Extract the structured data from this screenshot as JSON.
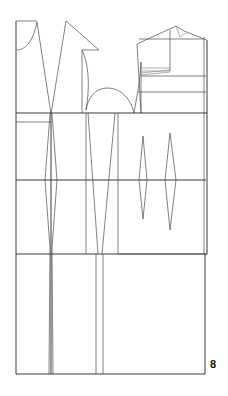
{
  "page": {
    "number": "8",
    "background_color": "#ffffff",
    "width": 228,
    "height": 396
  },
  "drawing": {
    "title": "Garment flat pattern draft",
    "ink_color": "#4a4a4a",
    "ink_color_strong": "#2e2e2e",
    "ink_color_light": "#8a8a8a",
    "stroke_width": "0.7"
  },
  "chart_data": {
    "type": "line",
    "xlabel": "",
    "ylabel": "",
    "grid": false,
    "legend": "none",
    "xlim": [
      0,
      228
    ],
    "ylim": [
      0,
      396
    ],
    "series": [
      {
        "name": "page-frame-left-edge",
        "kind": "polyline",
        "points": [
          [
            16,
            21
          ],
          [
            16,
            374
          ]
        ]
      },
      {
        "name": "page-frame-bottom-edge",
        "kind": "polyline",
        "points": [
          [
            16,
            374
          ],
          [
            205,
            374
          ]
        ]
      },
      {
        "name": "bodice-back-top-line",
        "kind": "polyline",
        "points": [
          [
            16,
            21
          ],
          [
            37,
            21
          ]
        ]
      },
      {
        "name": "back-neck-curve",
        "kind": "path",
        "d": "M 17 50 C 24 50 33 43 37 22"
      },
      {
        "name": "back-shoulder-line",
        "kind": "polyline",
        "points": [
          [
            37,
            22
          ],
          [
            51,
            114
          ]
        ]
      },
      {
        "name": "back-armhole-diagonal",
        "kind": "polyline",
        "points": [
          [
            51,
            114
          ],
          [
            66,
            21
          ]
        ]
      },
      {
        "name": "front-shoulder-diagonal",
        "kind": "polyline",
        "points": [
          [
            66,
            21
          ],
          [
            99,
            50
          ]
        ]
      },
      {
        "name": "front-neck-top-line",
        "kind": "polyline",
        "points": [
          [
            82,
            50
          ],
          [
            99,
            50
          ]
        ]
      },
      {
        "name": "front-neck-curve",
        "kind": "path",
        "d": "M 82 50 C 89 64 90 88 86 110"
      },
      {
        "name": "front-side-vertical",
        "kind": "polyline",
        "points": [
          [
            82,
            50
          ],
          [
            82,
            113
          ]
        ]
      },
      {
        "name": "sleeve-cap-curve",
        "kind": "path",
        "d": "M 86 110 C 88 98 95 88 107 88 C 122 88 131 100 134 113"
      },
      {
        "name": "sleeve-right-curve",
        "kind": "path",
        "d": "M 134 113 C 136 100 140 84 141 62"
      },
      {
        "name": "sleeve-center-vertical",
        "kind": "polyline",
        "points": [
          [
            141,
            62
          ],
          [
            141,
            113
          ]
        ]
      },
      {
        "name": "collar-left-slant",
        "kind": "polyline",
        "points": [
          [
            137,
            44
          ],
          [
            141,
            113
          ]
        ]
      },
      {
        "name": "collar-top-left-slant",
        "kind": "polyline",
        "points": [
          [
            137,
            44
          ],
          [
            176,
            26
          ]
        ]
      },
      {
        "name": "collar-peak-right-slant",
        "kind": "polyline",
        "points": [
          [
            176,
            26
          ],
          [
            184,
            31
          ]
        ]
      },
      {
        "name": "collar-apex-notch",
        "kind": "polyline",
        "points": [
          [
            176,
            26
          ],
          [
            180,
            37
          ],
          [
            186,
            33
          ]
        ]
      },
      {
        "name": "collar-outer-slant",
        "kind": "polyline",
        "points": [
          [
            184,
            31
          ],
          [
            207,
            40
          ]
        ]
      },
      {
        "name": "collar-right-vertical",
        "kind": "polyline",
        "points": [
          [
            207,
            40
          ],
          [
            207,
            254
          ]
        ]
      },
      {
        "name": "collar-inner-right-vertical",
        "kind": "polyline",
        "points": [
          [
            204,
            37
          ],
          [
            204,
            254
          ]
        ]
      },
      {
        "name": "collar-box-top-line",
        "kind": "polyline",
        "points": [
          [
            139,
            39
          ],
          [
            204,
            39
          ]
        ]
      },
      {
        "name": "collar-box-center-vertical",
        "kind": "polyline",
        "points": [
          [
            170,
            30
          ],
          [
            170,
            71
          ]
        ]
      },
      {
        "name": "collar-dart-line-a",
        "kind": "polyline",
        "points": [
          [
            141,
            68
          ],
          [
            170,
            68
          ]
        ]
      },
      {
        "name": "collar-dart-line-b",
        "kind": "polyline",
        "points": [
          [
            141,
            71
          ],
          [
            170,
            71
          ]
        ]
      },
      {
        "name": "collar-dart-line-c",
        "kind": "polyline",
        "points": [
          [
            141,
            73
          ],
          [
            170,
            70
          ]
        ]
      },
      {
        "name": "collar-dart-line-d",
        "kind": "polyline",
        "points": [
          [
            141,
            75
          ],
          [
            170,
            72
          ]
        ]
      },
      {
        "name": "chest-line-right",
        "kind": "polyline",
        "points": [
          [
            141,
            76
          ],
          [
            206,
            76
          ]
        ]
      },
      {
        "name": "upper-guide-line-right",
        "kind": "polyline",
        "points": [
          [
            138,
            92
          ],
          [
            206,
            92
          ]
        ]
      },
      {
        "name": "bust-line-full-width",
        "kind": "polyline",
        "points": [
          [
            16,
            113
          ],
          [
            207,
            113
          ]
        ]
      },
      {
        "name": "underbust-line-left",
        "kind": "polyline",
        "points": [
          [
            16,
            122
          ],
          [
            51,
            122
          ]
        ]
      },
      {
        "name": "left-block-vertical",
        "kind": "polyline",
        "points": [
          [
            51,
            113
          ],
          [
            51,
            374
          ]
        ]
      },
      {
        "name": "waist-line-full-width",
        "kind": "polyline",
        "points": [
          [
            16,
            180
          ],
          [
            206,
            180
          ]
        ]
      },
      {
        "name": "hip-line-full-width",
        "kind": "polyline",
        "points": [
          [
            16,
            254
          ],
          [
            207,
            254
          ]
        ]
      },
      {
        "name": "back-waist-dart-left",
        "kind": "polyline",
        "points": [
          [
            50,
            114
          ],
          [
            45,
            180
          ],
          [
            50,
            248
          ]
        ]
      },
      {
        "name": "back-waist-dart-right",
        "kind": "polyline",
        "points": [
          [
            52,
            114
          ],
          [
            57,
            180
          ],
          [
            52,
            248
          ]
        ]
      },
      {
        "name": "back-dart-leg-continue-a",
        "kind": "polyline",
        "points": [
          [
            50,
            248
          ],
          [
            49,
            374
          ]
        ]
      },
      {
        "name": "back-dart-leg-continue-b",
        "kind": "polyline",
        "points": [
          [
            52,
            248
          ],
          [
            53,
            374
          ]
        ]
      },
      {
        "name": "front-panel-left-vertical",
        "kind": "polyline",
        "points": [
          [
            86,
            113
          ],
          [
            86,
            254
          ]
        ]
      },
      {
        "name": "front-panel-slant-a",
        "kind": "polyline",
        "points": [
          [
            88,
            113
          ],
          [
            98,
            254
          ]
        ]
      },
      {
        "name": "front-panel-slant-b",
        "kind": "polyline",
        "points": [
          [
            115,
            113
          ],
          [
            102,
            254
          ]
        ]
      },
      {
        "name": "front-panel-right-vertical",
        "kind": "polyline",
        "points": [
          [
            118,
            113
          ],
          [
            118,
            254
          ]
        ]
      },
      {
        "name": "front-panel-leg-continue-a",
        "kind": "polyline",
        "points": [
          [
            96,
            254
          ],
          [
            96,
            374
          ]
        ]
      },
      {
        "name": "front-panel-leg-continue-b",
        "kind": "polyline",
        "points": [
          [
            103,
            254
          ],
          [
            103,
            374
          ]
        ]
      },
      {
        "name": "side-dart-inner",
        "kind": "polyline",
        "points": [
          [
            143,
            136
          ],
          [
            139,
            180
          ],
          [
            143,
            219
          ]
        ]
      },
      {
        "name": "side-dart-outer",
        "kind": "polyline",
        "points": [
          [
            143,
            136
          ],
          [
            147,
            180
          ],
          [
            143,
            219
          ]
        ]
      },
      {
        "name": "side-dart-waist-tick",
        "kind": "polyline",
        "points": [
          [
            139,
            180
          ],
          [
            147,
            180
          ]
        ]
      },
      {
        "name": "far-side-dart-inner",
        "kind": "polyline",
        "points": [
          [
            170,
            133
          ],
          [
            165,
            180
          ],
          [
            170,
            230
          ]
        ]
      },
      {
        "name": "far-side-dart-outer",
        "kind": "polyline",
        "points": [
          [
            170,
            133
          ],
          [
            176,
            180
          ],
          [
            170,
            230
          ]
        ]
      },
      {
        "name": "hem-line-right-extension",
        "kind": "polyline",
        "points": [
          [
            118,
            254
          ],
          [
            207,
            254
          ]
        ]
      },
      {
        "name": "right-block-outer-vertical",
        "kind": "polyline",
        "points": [
          [
            205,
            254
          ],
          [
            205,
            374
          ]
        ]
      }
    ]
  }
}
